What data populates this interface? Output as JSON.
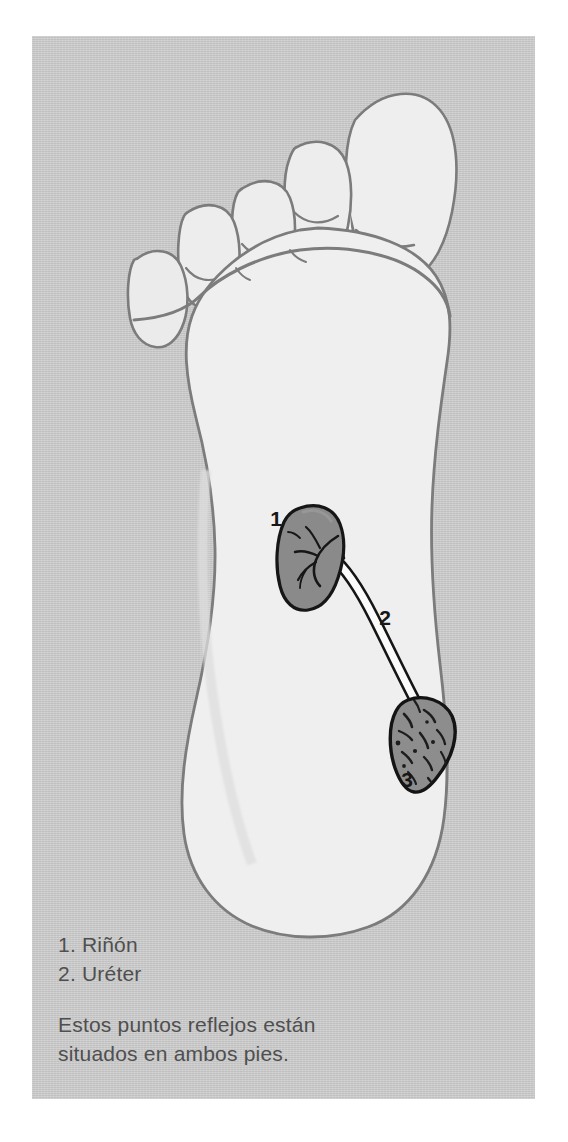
{
  "illustration": {
    "subject": "foot-sole-reflexology-diagram",
    "view": "plantar view of right foot sole",
    "background_color": "#c9c9c9",
    "page_color": "#ffffff",
    "foot_fill": "#efefef",
    "foot_outline_color": "#7a7a7a",
    "organ_fill": "#8a8a8a",
    "organ_outline_color": "#1c1c1c",
    "tube_fill": "#fbfbfb",
    "text_color": "#4f4f4f",
    "label_color": "#1c1c1c"
  },
  "markers": [
    {
      "id": "1",
      "label": "1",
      "organ": "kidney-reflex-point",
      "x": 276,
      "y": 518
    },
    {
      "id": "2",
      "label": "2",
      "organ": "ureter-reflex-point",
      "x": 385,
      "y": 617
    },
    {
      "id": "3",
      "label": "3",
      "organ": "bladder-reflex-point",
      "x": 407,
      "y": 779
    }
  ],
  "legend": {
    "items": [
      {
        "number": "1.",
        "name": "Riñón",
        "text": "1. Riñón"
      },
      {
        "number": "2.",
        "name": "Uréter",
        "text": "2. Uréter"
      }
    ]
  },
  "note": {
    "line1": "Estos puntos reflejos están",
    "line2": "situados en ambos pies."
  }
}
